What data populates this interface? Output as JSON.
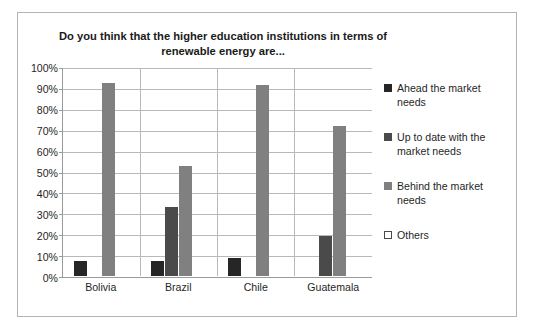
{
  "chart_data": {
    "type": "bar",
    "title": "Do you think that the higher education institutions in terms of renewable energy are...",
    "xlabel": "",
    "ylabel": "",
    "categories": [
      "Bolivia",
      "Brazil",
      "Chile",
      "Guatemala"
    ],
    "series": [
      {
        "name": "Ahead the market needs",
        "color": "#262626",
        "values": [
          7,
          7,
          8.5,
          0
        ]
      },
      {
        "name": "Up to date with the market needs",
        "color": "#4a4a4a",
        "values": [
          0,
          33,
          0,
          19
        ]
      },
      {
        "name": "Behind the market needs",
        "color": "#808080",
        "values": [
          93,
          53,
          92,
          72
        ]
      },
      {
        "name": "Others",
        "color": "#ffffff",
        "values": [
          0,
          0,
          0,
          0
        ]
      }
    ],
    "ylim": [
      0,
      100
    ],
    "ytick_labels": [
      "100%",
      "90%",
      "80%",
      "70%",
      "60%",
      "50%",
      "40%",
      "30%",
      "20%",
      "10%",
      "0%"
    ],
    "ytick_values": [
      100,
      90,
      80,
      70,
      60,
      50,
      40,
      30,
      20,
      10,
      0
    ],
    "grid": "horizontal",
    "legend_position": "right",
    "value_suffix": "%"
  },
  "legend": {
    "items": [
      {
        "label": "Ahead the market needs",
        "color": "#262626",
        "outlined": false
      },
      {
        "label": "Up to date with the market needs",
        "color": "#4a4a4a",
        "outlined": false
      },
      {
        "label": "Behind the market needs",
        "color": "#808080",
        "outlined": false
      },
      {
        "label": "Others",
        "color": "#ffffff",
        "outlined": true
      }
    ]
  }
}
